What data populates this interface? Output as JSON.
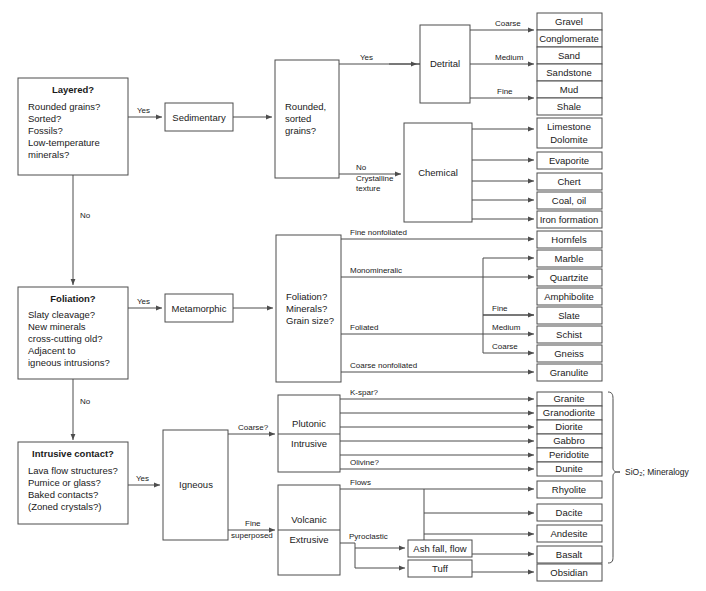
{
  "colors": {
    "stroke": "#4d4d4d",
    "text": "#1a1a1a",
    "background": "#ffffff"
  },
  "decisions": [
    {
      "id": "layered",
      "heading": "Layered?",
      "lines": [
        "Rounded grains?",
        "Sorted?",
        "Fossils?",
        "Low-temperature",
        "minerals?"
      ],
      "yes_label": "Yes",
      "no_label": "No"
    },
    {
      "id": "foliation",
      "heading": "Foliation?",
      "lines": [
        "Slaty cleavage?",
        "New minerals",
        "cross-cutting old?",
        "Adjacent to",
        "igneous intrusions?"
      ],
      "yes_label": "Yes",
      "no_label": "No"
    },
    {
      "id": "intrusive",
      "heading": "Intrusive contact?",
      "lines": [
        "Lava flow structures?",
        "Pumice or glass?",
        "Baked contacts?",
        "(Zoned crystals?)"
      ],
      "yes_label": "Yes",
      "no_label": ""
    }
  ],
  "classes": [
    {
      "id": "sedimentary",
      "label": "Sedimentary"
    },
    {
      "id": "metamorphic",
      "label": "Metamorphic"
    },
    {
      "id": "igneous",
      "label": "Igneous"
    }
  ],
  "criteria": [
    {
      "id": "sed-criteria",
      "lines": [
        "Rounded,",
        "sorted",
        "grains?"
      ]
    },
    {
      "id": "met-criteria",
      "lines": [
        "Foliation?",
        "Minerals?",
        "Grain size?"
      ]
    }
  ],
  "groups": [
    {
      "id": "detrital",
      "label": "Detrital"
    },
    {
      "id": "chemical",
      "label": "Chemical"
    },
    {
      "id": "plutonic",
      "label_top": "Plutonic",
      "label_bottom": "Intrusive"
    },
    {
      "id": "volcanic",
      "label_top": "Volcanic",
      "label_bottom": "Extrusive"
    }
  ],
  "edge_labels": {
    "sed_yes": "Yes",
    "sed_no": "No",
    "sed_no_sub1": "Crystalline",
    "sed_no_sub2": "texture",
    "detrital_coarse": "Coarse",
    "detrital_medium": "Medium",
    "detrital_fine": "Fine",
    "met_fine_nonfoliated": "Fine nonfoliated",
    "met_monomineralic": "Monomineralic",
    "met_foliated": "Foliated",
    "met_coarse_nonfoliated": "Coarse nonfoliated",
    "met_fine": "Fine",
    "met_medium": "Medium",
    "met_coarse": "Coarse",
    "ign_coarse": "Coarse?",
    "ign_fine": "Fine",
    "ign_superposed": "superposed",
    "ign_kspar": "K-spar?",
    "ign_olivine": "Olivine?",
    "ign_flows": "Flows",
    "ign_pyroclastic": "Pyroclastic",
    "ign_allglass": "All glass"
  },
  "sedimentary_detrital_products": [
    {
      "top": "Gravel",
      "bottom": "Conglomerate",
      "size": "Coarse"
    },
    {
      "top": "Sand",
      "bottom": "Sandstone",
      "size": "Medium"
    },
    {
      "top": "Mud",
      "bottom": "Shale",
      "size": "Fine"
    }
  ],
  "sedimentary_chemical_products": [
    {
      "top": "Limestone",
      "bottom": "Dolomite"
    },
    {
      "top": "Evaporite",
      "bottom": ""
    },
    {
      "top": "Chert",
      "bottom": ""
    },
    {
      "top": "Coal, oil",
      "bottom": ""
    },
    {
      "top": "Iron formation",
      "bottom": ""
    }
  ],
  "metamorphic_products": [
    {
      "name": "Hornfels",
      "texture": "Fine nonfoliated"
    },
    {
      "name": "Marble",
      "texture": "Monomineralic"
    },
    {
      "name": "Quartzite",
      "texture": "Monomineralic"
    },
    {
      "name": "Amphibolite",
      "texture": "Monomineralic"
    },
    {
      "name": "Slate",
      "texture": "Foliated",
      "grain": "Fine"
    },
    {
      "name": "Schist",
      "texture": "Foliated",
      "grain": "Medium"
    },
    {
      "name": "Gneiss",
      "texture": "Foliated",
      "grain": "Coarse"
    },
    {
      "name": "Granulite",
      "texture": "Coarse nonfoliated"
    }
  ],
  "igneous_plutonic_products": [
    {
      "name": "Granite",
      "note": "K-spar?"
    },
    {
      "name": "Granodiorite",
      "note": ""
    },
    {
      "name": "Diorite",
      "note": ""
    },
    {
      "name": "Gabbro",
      "note": ""
    },
    {
      "name": "Peridotite",
      "note": ""
    },
    {
      "name": "Dunite",
      "note": "Olivine?"
    }
  ],
  "igneous_volcanic_products": [
    {
      "name": "Rhyolite",
      "note": "Flows"
    },
    {
      "name": "Dacite",
      "note": ""
    },
    {
      "name": "Andesite",
      "note": ""
    },
    {
      "name": "Basalt",
      "note": ""
    },
    {
      "name": "Obsidian",
      "note": "All glass"
    }
  ],
  "igneous_pyroclastic_products": [
    {
      "name": "Ash fall, flow"
    },
    {
      "name": "Tuff"
    }
  ],
  "annotations": [
    {
      "id": "sio2-mineralogy",
      "text": "SiO₂; Mineralogy"
    }
  ]
}
